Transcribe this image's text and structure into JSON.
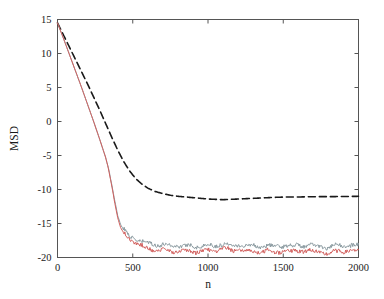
{
  "chart_data": {
    "type": "line",
    "title": "",
    "xlabel": "n",
    "ylabel": "MSD",
    "xlim": [
      0,
      2000
    ],
    "ylim": [
      -20,
      15
    ],
    "grid": false,
    "legend": "none",
    "xticks": [
      0,
      500,
      1000,
      1500,
      2000
    ],
    "xtick_labels": [
      "0",
      "500",
      "1000",
      "1500",
      "2000"
    ],
    "yticks": [
      15,
      10,
      5,
      0,
      -5,
      -10,
      -15,
      -20
    ],
    "ytick_labels": [
      "15",
      "10",
      "5",
      "0",
      "-5",
      "-10",
      "-15",
      "-20"
    ],
    "colors": {
      "dashed_black": "#1a1a1a",
      "gray_blue": "#8a9aa0",
      "red": "#d2605e",
      "axis": "#555555"
    },
    "series": [
      {
        "name": "dashed-curve",
        "style": "dashed",
        "color": "#1a1a1a",
        "x": [
          0,
          40,
          80,
          120,
          160,
          200,
          240,
          280,
          320,
          360,
          400,
          440,
          480,
          520,
          560,
          600,
          650,
          700,
          750,
          800,
          850,
          900,
          950,
          1000,
          1050,
          1100,
          1150,
          1200,
          1250,
          1300,
          1350,
          1400,
          1450,
          1500,
          1550,
          1600,
          1650,
          1700,
          1750,
          1800,
          1850,
          1900,
          1950,
          2000
        ],
        "values": [
          14.5,
          12.7,
          10.9,
          9.1,
          7.3,
          5.5,
          3.6,
          1.7,
          -0.3,
          -2.3,
          -4.2,
          -5.9,
          -7.3,
          -8.4,
          -9.2,
          -9.8,
          -10.3,
          -10.6,
          -10.85,
          -11.0,
          -11.1,
          -11.2,
          -11.3,
          -11.4,
          -11.45,
          -11.5,
          -11.45,
          -11.4,
          -11.35,
          -11.3,
          -11.25,
          -11.2,
          -11.15,
          -11.12,
          -11.1,
          -11.1,
          -11.08,
          -11.06,
          -11.05,
          -11.05,
          -11.04,
          -11.03,
          -11.02,
          -11.0
        ]
      },
      {
        "name": "gray-blue-curve",
        "style": "solid",
        "color": "#8a9aa0",
        "x": [
          0,
          40,
          80,
          120,
          160,
          200,
          240,
          280,
          320,
          340,
          360,
          380,
          400,
          420,
          440,
          460,
          480,
          500,
          520,
          540,
          560,
          580,
          600,
          640,
          680,
          720,
          760,
          800,
          840,
          880,
          920,
          960,
          1000,
          1040,
          1080,
          1120,
          1160,
          1200,
          1240,
          1280,
          1320,
          1360,
          1400,
          1440,
          1480,
          1520,
          1560,
          1600,
          1640,
          1680,
          1720,
          1760,
          1800,
          1840,
          1880,
          1920,
          1960,
          2000
        ],
        "values": [
          14.5,
          12.2,
          9.8,
          7.4,
          5.0,
          2.5,
          0.0,
          -2.6,
          -5.3,
          -7.0,
          -9.2,
          -11.6,
          -13.8,
          -15.2,
          -15.9,
          -16.4,
          -16.8,
          -17.1,
          -17.3,
          -17.5,
          -17.7,
          -17.8,
          -17.9,
          -18.0,
          -18.2,
          -18.1,
          -18.3,
          -18.2,
          -18.35,
          -18.25,
          -18.4,
          -18.3,
          -18.2,
          -18.35,
          -18.1,
          -18.0,
          -18.2,
          -18.1,
          -18.3,
          -18.2,
          -18.35,
          -18.4,
          -18.25,
          -18.4,
          -18.3,
          -18.2,
          -18.35,
          -18.15,
          -18.3,
          -18.2,
          -18.3,
          -18.4,
          -18.6,
          -18.3,
          -18.2,
          -18.35,
          -18.2,
          -18.25
        ]
      },
      {
        "name": "red-curve",
        "style": "solid",
        "color": "#d2605e",
        "x": [
          0,
          40,
          80,
          120,
          160,
          200,
          240,
          280,
          320,
          340,
          360,
          380,
          400,
          420,
          440,
          460,
          480,
          500,
          520,
          540,
          560,
          580,
          600,
          640,
          680,
          720,
          760,
          800,
          840,
          880,
          920,
          960,
          1000,
          1040,
          1080,
          1120,
          1160,
          1200,
          1240,
          1280,
          1320,
          1360,
          1400,
          1440,
          1480,
          1520,
          1560,
          1600,
          1640,
          1680,
          1720,
          1760,
          1800,
          1840,
          1880,
          1920,
          1960,
          2000
        ],
        "values": [
          14.5,
          12.2,
          9.8,
          7.4,
          5.0,
          2.5,
          0.0,
          -2.6,
          -5.3,
          -7.1,
          -9.4,
          -11.9,
          -14.2,
          -15.6,
          -16.4,
          -16.9,
          -17.3,
          -17.6,
          -17.9,
          -18.1,
          -18.3,
          -18.5,
          -18.6,
          -18.8,
          -19.0,
          -18.9,
          -19.1,
          -19.0,
          -19.15,
          -19.0,
          -19.2,
          -19.05,
          -18.9,
          -19.1,
          -18.8,
          -18.7,
          -18.95,
          -18.85,
          -19.1,
          -19.0,
          -19.15,
          -19.2,
          -19.0,
          -19.2,
          -19.1,
          -18.95,
          -19.15,
          -18.9,
          -19.1,
          -19.0,
          -19.1,
          -19.25,
          -19.6,
          -19.1,
          -18.95,
          -19.15,
          -19.0,
          -19.05
        ]
      }
    ]
  }
}
